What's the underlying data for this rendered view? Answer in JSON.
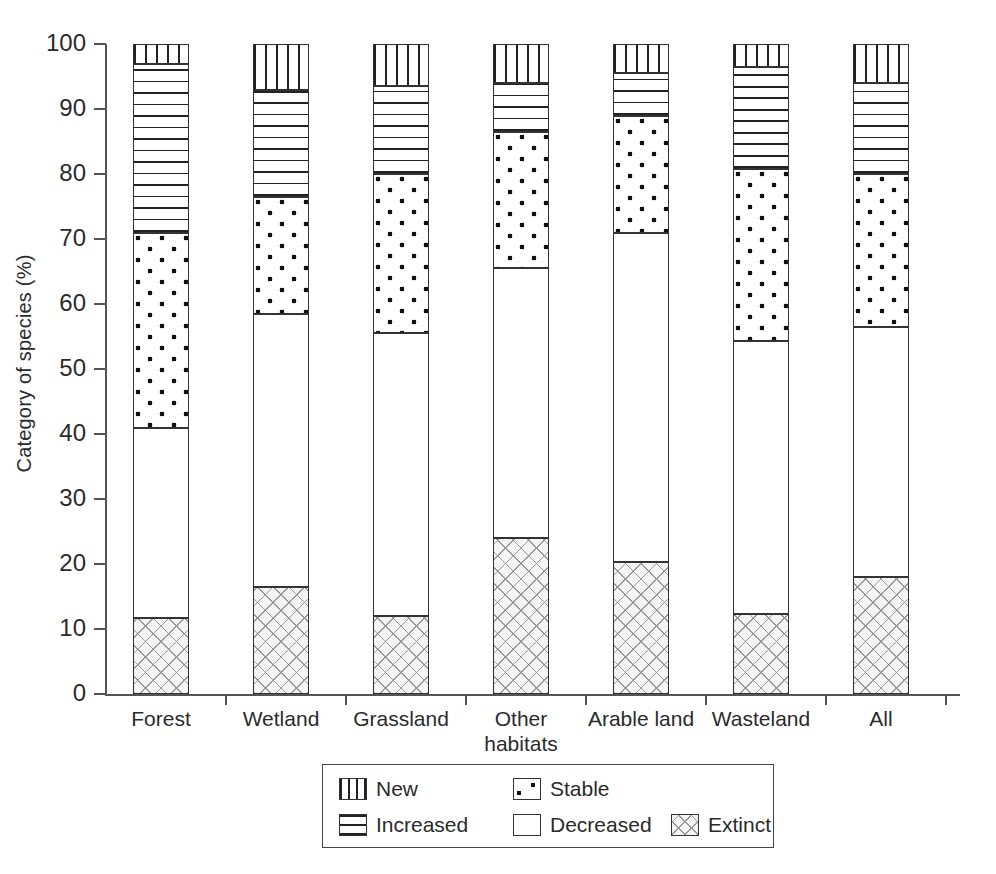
{
  "chart_data": {
    "type": "bar",
    "subtype": "stacked-bar",
    "title": "",
    "xlabel": "",
    "ylabel": "Category of species (%)",
    "ylim": [
      0,
      100
    ],
    "yticks": [
      0,
      10,
      20,
      30,
      40,
      50,
      60,
      70,
      80,
      90,
      100
    ],
    "grid": false,
    "legend_position": "bottom",
    "stack_order_bottom_to_top": [
      "Extinct",
      "Decreased",
      "Stable",
      "Increased",
      "New"
    ],
    "categories": [
      "Forest",
      "Wetland",
      "Grassland",
      "Other habitats",
      "Arable land",
      "Wasteland",
      "All"
    ],
    "category_lines": [
      [
        "Forest"
      ],
      [
        "Wetland"
      ],
      [
        "Grassland"
      ],
      [
        "Other",
        "habitats"
      ],
      [
        "Arable land"
      ],
      [
        "Wasteland"
      ],
      [
        "All"
      ]
    ],
    "series": [
      {
        "name": "Extinct",
        "pattern": "cross-hatch-light",
        "values": [
          11.7,
          16.5,
          12.0,
          24.0,
          20.3,
          12.3,
          18.0
        ]
      },
      {
        "name": "Decreased",
        "pattern": "dark-checker",
        "values": [
          29.3,
          42.0,
          43.5,
          41.5,
          50.7,
          42.0,
          38.5
        ]
      },
      {
        "name": "Stable",
        "pattern": "dots",
        "values": [
          30.0,
          18.0,
          24.5,
          21.0,
          18.0,
          26.4,
          23.5
        ]
      },
      {
        "name": "Increased",
        "pattern": "horizontal-lines",
        "values": [
          26.0,
          16.5,
          13.5,
          7.5,
          6.5,
          15.8,
          14.0
        ]
      },
      {
        "name": "New",
        "pattern": "vertical-lines",
        "values": [
          3.0,
          7.0,
          6.5,
          6.0,
          4.5,
          3.5,
          6.0
        ]
      }
    ],
    "cumulative_tops": {
      "Forest": {
        "Extinct": 11.7,
        "Decreased": 41.0,
        "Stable": 71.0,
        "Increased": 97.0,
        "New": 100
      },
      "Wetland": {
        "Extinct": 16.5,
        "Decreased": 58.5,
        "Stable": 76.5,
        "Increased": 93.0,
        "New": 100
      },
      "Grassland": {
        "Extinct": 12.0,
        "Decreased": 55.5,
        "Stable": 80.0,
        "Increased": 93.5,
        "New": 100
      },
      "Other habitats": {
        "Extinct": 24.0,
        "Decreased": 65.5,
        "Stable": 86.5,
        "Increased": 94.0,
        "New": 100
      },
      "Arable land": {
        "Extinct": 20.3,
        "Decreased": 71.0,
        "Stable": 89.0,
        "Increased": 95.5,
        "New": 100
      },
      "Wasteland": {
        "Extinct": 12.3,
        "Decreased": 54.3,
        "Stable": 80.7,
        "Increased": 96.5,
        "New": 100
      },
      "All": {
        "Extinct": 18.0,
        "Decreased": 56.5,
        "Stable": 80.0,
        "Increased": 94.0,
        "New": 100
      }
    }
  },
  "legend": {
    "entries": [
      {
        "label": "New",
        "pattern": "vertical-lines"
      },
      {
        "label": "Stable",
        "pattern": "dots"
      },
      {
        "label": "Increased",
        "pattern": "horizontal-lines"
      },
      {
        "label": "Decreased",
        "pattern": "dark-checker"
      },
      {
        "label": "Extinct",
        "pattern": "cross-hatch-light"
      }
    ]
  },
  "colors": {
    "ink": "#1b1b1b",
    "axis": "#555555",
    "extinct_fill": "#f4f4f4",
    "extinct_hatch": "#9a9a9a",
    "decreased_fill": "#1b1b1b",
    "background": "#ffffff"
  }
}
